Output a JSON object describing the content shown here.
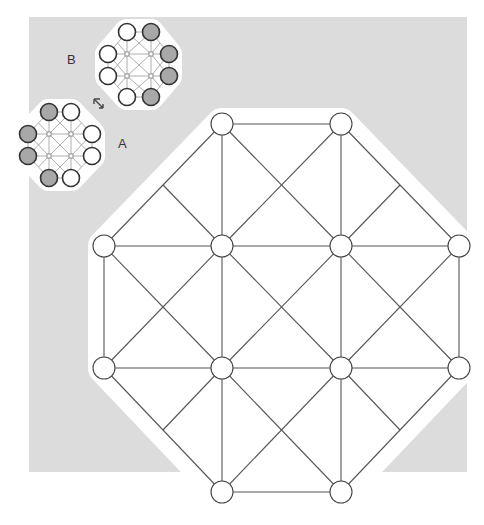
{
  "colors": {
    "background": "#ffffff",
    "panel": "#dcdcdc",
    "line": "#555555",
    "mini_line": "#999999",
    "node_stroke": "#444444",
    "node_white": "#ffffff",
    "node_grey": "#a8a8a8"
  },
  "labels": {
    "a": "A",
    "b": "B"
  },
  "move_icon": "diagonal-arrow-icon",
  "main_board": {
    "grid_x": [
      104,
      222,
      341,
      459
    ],
    "grid_y": [
      124,
      246,
      368,
      492
    ],
    "node_radius": 11,
    "nodes": [
      {
        "x": 222,
        "y": 124
      },
      {
        "x": 341,
        "y": 124
      },
      {
        "x": 104,
        "y": 246
      },
      {
        "x": 222,
        "y": 246
      },
      {
        "x": 341,
        "y": 246
      },
      {
        "x": 459,
        "y": 246
      },
      {
        "x": 104,
        "y": 368
      },
      {
        "x": 222,
        "y": 368
      },
      {
        "x": 341,
        "y": 368
      },
      {
        "x": 459,
        "y": 368
      },
      {
        "x": 222,
        "y": 492
      },
      {
        "x": 341,
        "y": 492
      }
    ]
  },
  "mini_boards": [
    {
      "name": "A",
      "grid_x": [
        28,
        49,
        71,
        92
      ],
      "grid_y": [
        112,
        134,
        156,
        178
      ],
      "pieces": [
        {
          "x": 49,
          "y": 112,
          "color": "grey"
        },
        {
          "x": 71,
          "y": 112,
          "color": "white"
        },
        {
          "x": 28,
          "y": 134,
          "color": "grey"
        },
        {
          "x": 28,
          "y": 156,
          "color": "grey"
        },
        {
          "x": 92,
          "y": 134,
          "color": "white"
        },
        {
          "x": 92,
          "y": 156,
          "color": "white"
        },
        {
          "x": 49,
          "y": 178,
          "color": "grey"
        },
        {
          "x": 71,
          "y": 178,
          "color": "white"
        }
      ]
    },
    {
      "name": "B",
      "grid_x": [
        108,
        127,
        151,
        169
      ],
      "grid_y": [
        32,
        54,
        76,
        97
      ],
      "pieces": [
        {
          "x": 127,
          "y": 32,
          "color": "white"
        },
        {
          "x": 151,
          "y": 32,
          "color": "grey"
        },
        {
          "x": 108,
          "y": 54,
          "color": "white"
        },
        {
          "x": 108,
          "y": 76,
          "color": "white"
        },
        {
          "x": 169,
          "y": 54,
          "color": "grey"
        },
        {
          "x": 169,
          "y": 76,
          "color": "grey"
        },
        {
          "x": 127,
          "y": 97,
          "color": "white"
        },
        {
          "x": 151,
          "y": 97,
          "color": "grey"
        }
      ]
    }
  ]
}
